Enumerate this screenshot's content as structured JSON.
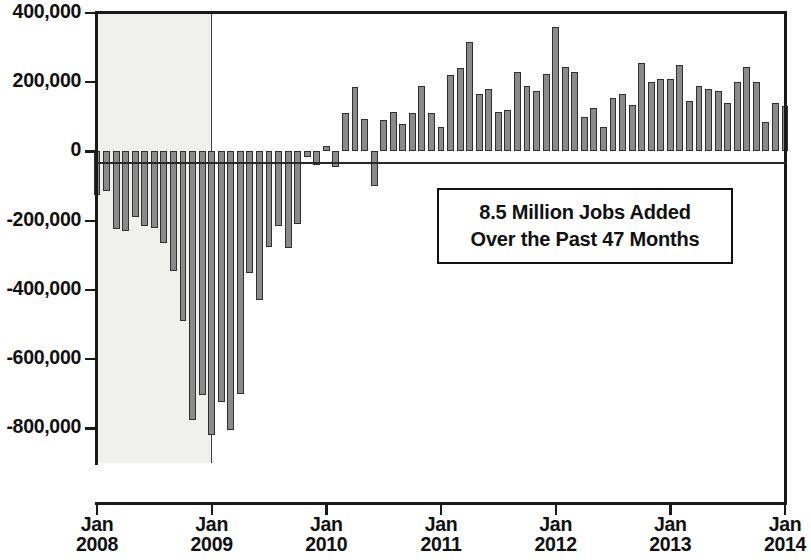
{
  "chart_data": {
    "type": "bar",
    "title": "",
    "xlabel": "",
    "ylabel": "",
    "ylim": [
      -900000,
      400000
    ],
    "grid": false,
    "legend": null,
    "y_ticks": [
      "400,000",
      "200,000",
      "0",
      "-200,000",
      "-400,000",
      "-600,000",
      "-800,000"
    ],
    "y_tick_values": [
      400000,
      200000,
      0,
      -200000,
      -400000,
      -600000,
      -800000
    ],
    "x_ticks": [
      {
        "month": "Jan",
        "year": "2008"
      },
      {
        "month": "Jan",
        "year": "2009"
      },
      {
        "month": "Jan",
        "year": "2010"
      },
      {
        "month": "Jan",
        "year": "2011"
      },
      {
        "month": "Jan",
        "year": "2012"
      },
      {
        "month": "Jan",
        "year": "2013"
      },
      {
        "month": "Jan",
        "year": "2014"
      }
    ],
    "categories": [
      "Jan 2008",
      "Feb 2008",
      "Mar 2008",
      "Apr 2008",
      "May 2008",
      "Jun 2008",
      "Jul 2008",
      "Aug 2008",
      "Sep 2008",
      "Oct 2008",
      "Nov 2008",
      "Dec 2008",
      "Jan 2009",
      "Feb 2009",
      "Mar 2009",
      "Apr 2009",
      "May 2009",
      "Jun 2009",
      "Jul 2009",
      "Aug 2009",
      "Sep 2009",
      "Oct 2009",
      "Nov 2009",
      "Dec 2009",
      "Jan 2010",
      "Feb 2010",
      "Mar 2010",
      "Apr 2010",
      "May 2010",
      "Jun 2010",
      "Jul 2010",
      "Aug 2010",
      "Sep 2010",
      "Oct 2010",
      "Nov 2010",
      "Dec 2010",
      "Jan 2011",
      "Feb 2011",
      "Mar 2011",
      "Apr 2011",
      "May 2011",
      "Jun 2011",
      "Jul 2011",
      "Aug 2011",
      "Sep 2011",
      "Oct 2011",
      "Nov 2011",
      "Dec 2011",
      "Jan 2012",
      "Feb 2012",
      "Mar 2012",
      "Apr 2012",
      "May 2012",
      "Jun 2012",
      "Jul 2012",
      "Aug 2012",
      "Sep 2012",
      "Oct 2012",
      "Nov 2012",
      "Dec 2012",
      "Jan 2013",
      "Feb 2013",
      "Mar 2013",
      "Apr 2013",
      "May 2013",
      "Jun 2013",
      "Jul 2013",
      "Aug 2013",
      "Sep 2013",
      "Oct 2013",
      "Nov 2013",
      "Dec 2013",
      "Jan 2014"
    ],
    "values": [
      -125000,
      -115000,
      -225000,
      -230000,
      -190000,
      -215000,
      -220000,
      -265000,
      -345000,
      -490000,
      -775000,
      -705000,
      -820000,
      -725000,
      -805000,
      -700000,
      -350000,
      -430000,
      -275000,
      -215000,
      -280000,
      -210000,
      -15000,
      -40000,
      15000,
      -45000,
      110000,
      185000,
      95000,
      -100000,
      90000,
      115000,
      80000,
      110000,
      190000,
      110000,
      70000,
      220000,
      240000,
      315000,
      165000,
      180000,
      115000,
      120000,
      230000,
      190000,
      175000,
      225000,
      360000,
      245000,
      230000,
      100000,
      125000,
      70000,
      155000,
      165000,
      135000,
      255000,
      200000,
      210000,
      210000,
      250000,
      145000,
      190000,
      180000,
      175000,
      140000,
      200000,
      245000,
      200000,
      85000,
      140000,
      130000
    ],
    "bar_color": "#8a8a8a",
    "bar_edge_color": "#303030",
    "recession_shading": {
      "label": "recession-band",
      "from": "Jan 2008",
      "to": "Jan 2009",
      "color": "#f0f0ee"
    },
    "annotation": {
      "line1": "8.5 Million Jobs Added",
      "line2": "Over the Past 47 Months"
    }
  }
}
